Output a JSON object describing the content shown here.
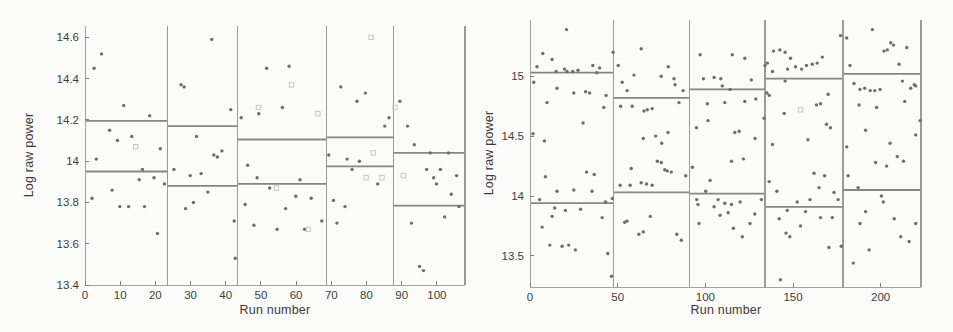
{
  "figure": {
    "background": "#fbfbf9",
    "point_color": "#6d6d6d",
    "square_color": "#c7c7c7",
    "mean_line_color": "#868686",
    "divider_color": "#9a9a9a",
    "axis_color": "#a2a2a2",
    "tick_color": "#7e7e7e",
    "text_color": "#3d3d3d"
  },
  "chart_data": [
    {
      "type": "scatter",
      "title": "",
      "xlabel": "Run number",
      "ylabel": "Log raw power",
      "xlim": [
        0,
        108
      ],
      "ylim": [
        13.4,
        14.655
      ],
      "xticks": [
        0,
        10,
        20,
        30,
        40,
        50,
        60,
        70,
        80,
        90,
        100
      ],
      "yticks": [
        13.4,
        13.6,
        13.8,
        14,
        14.2,
        14.4,
        14.6
      ],
      "grid": false,
      "legend": null,
      "segment_boundaries": [
        0,
        23.4,
        43.3,
        68.6,
        87.6,
        108
      ],
      "segments": [
        {
          "upper": 14.195,
          "lower": 13.95
        },
        {
          "upper": 14.17,
          "lower": 13.88
        },
        {
          "upper": 14.105,
          "lower": 13.89
        },
        {
          "upper": 14.115,
          "lower": 13.975
        },
        {
          "upper": 14.04,
          "lower": 13.785
        }
      ],
      "points": [
        [
          2.6,
          14.45
        ],
        [
          4.7,
          14.52
        ],
        [
          11,
          14.27
        ],
        [
          18.4,
          14.22
        ],
        [
          7,
          14.15
        ],
        [
          9.2,
          14.1
        ],
        [
          13.3,
          14.12
        ],
        [
          21.4,
          14.06
        ],
        [
          3.2,
          14.01
        ],
        [
          16.3,
          13.96
        ],
        [
          19.6,
          13.92
        ],
        [
          15.4,
          13.91
        ],
        [
          7.7,
          13.86
        ],
        [
          2.0,
          13.82
        ],
        [
          9.9,
          13.78
        ],
        [
          12.4,
          13.78
        ],
        [
          16.9,
          13.78
        ],
        [
          20.6,
          13.65
        ],
        [
          22.6,
          13.89
        ],
        [
          27.3,
          14.37
        ],
        [
          28.2,
          14.36
        ],
        [
          36,
          14.59
        ],
        [
          41.4,
          14.25
        ],
        [
          31.7,
          14.12
        ],
        [
          36.6,
          14.03
        ],
        [
          37.6,
          14.02
        ],
        [
          38.9,
          14.05
        ],
        [
          25.3,
          13.96
        ],
        [
          29.9,
          13.93
        ],
        [
          33,
          13.94
        ],
        [
          34.9,
          13.85
        ],
        [
          28.6,
          13.77
        ],
        [
          30.8,
          13.8
        ],
        [
          42.4,
          13.71
        ],
        [
          42.7,
          13.53
        ],
        [
          44.4,
          14.21
        ],
        [
          51.6,
          14.45
        ],
        [
          58,
          14.46
        ],
        [
          56.1,
          14.26
        ],
        [
          49.4,
          14.23
        ],
        [
          46.2,
          13.98
        ],
        [
          48.9,
          13.92
        ],
        [
          52.5,
          13.87
        ],
        [
          61.1,
          13.91
        ],
        [
          59.9,
          13.83
        ],
        [
          64.3,
          13.82
        ],
        [
          57,
          13.77
        ],
        [
          54.6,
          13.67
        ],
        [
          62.4,
          13.67
        ],
        [
          67.3,
          13.71
        ],
        [
          45.5,
          13.79
        ],
        [
          48,
          13.69
        ],
        [
          72.7,
          14.36
        ],
        [
          79.7,
          14.33
        ],
        [
          77.3,
          14.29
        ],
        [
          86.4,
          14.21
        ],
        [
          85.2,
          14.17
        ],
        [
          69.3,
          14.03
        ],
        [
          74.5,
          14.01
        ],
        [
          78,
          14.0
        ],
        [
          75.9,
          13.96
        ],
        [
          83.2,
          13.89
        ],
        [
          70.6,
          13.81
        ],
        [
          73.9,
          13.78
        ],
        [
          71.6,
          13.7
        ],
        [
          89.5,
          14.29
        ],
        [
          91.7,
          14.17
        ],
        [
          93.6,
          14.08
        ],
        [
          98.1,
          14.04
        ],
        [
          103.3,
          14.04
        ],
        [
          97.1,
          13.96
        ],
        [
          101,
          13.96
        ],
        [
          99.1,
          13.92
        ],
        [
          99.9,
          13.89
        ],
        [
          105.6,
          13.93
        ],
        [
          104.1,
          13.84
        ],
        [
          106.3,
          13.78
        ],
        [
          102.2,
          13.73
        ],
        [
          92.8,
          13.7
        ],
        [
          95.1,
          13.49
        ],
        [
          96.2,
          13.47
        ]
      ],
      "outlier_squares": [
        [
          14.4,
          14.07
        ],
        [
          49.3,
          14.26
        ],
        [
          58.7,
          14.37
        ],
        [
          66.2,
          14.23
        ],
        [
          81.3,
          14.6
        ],
        [
          54.4,
          13.87
        ],
        [
          63.5,
          13.67
        ],
        [
          79.9,
          13.92
        ],
        [
          84.4,
          13.92
        ],
        [
          81.9,
          14.04
        ],
        [
          88.1,
          14.26
        ],
        [
          90.5,
          13.93
        ]
      ]
    },
    {
      "type": "scatter",
      "title": "",
      "xlabel": "Run number",
      "ylabel": "Log raw power",
      "xlim": [
        0,
        223
      ],
      "ylim": [
        13.24,
        15.47
      ],
      "xticks": [
        0,
        50,
        100,
        150,
        200
      ],
      "yticks": [
        13.5,
        14,
        14.5,
        15
      ],
      "grid": false,
      "legend": null,
      "segment_boundaries": [
        0,
        47.5,
        91,
        134,
        178.5,
        223
      ],
      "segments": [
        {
          "upper": 15.03,
          "lower": 13.94
        },
        {
          "upper": 14.82,
          "lower": 14.03
        },
        {
          "upper": 14.89,
          "lower": 14.02
        },
        {
          "upper": 14.98,
          "lower": 13.91
        },
        {
          "upper": 15.02,
          "lower": 14.05
        }
      ],
      "points": [
        [
          20.8,
          15.39
        ],
        [
          7.3,
          15.19
        ],
        [
          12.6,
          15.14
        ],
        [
          4.0,
          15.08
        ],
        [
          14.9,
          15.04
        ],
        [
          19.7,
          15.06
        ],
        [
          21.1,
          15.04
        ],
        [
          24.4,
          15.04
        ],
        [
          27.4,
          15.05
        ],
        [
          35.8,
          15.09
        ],
        [
          39.7,
          15.07
        ],
        [
          38.1,
          15.03
        ],
        [
          2.1,
          14.95
        ],
        [
          15.4,
          14.9
        ],
        [
          25,
          14.86
        ],
        [
          31.7,
          14.87
        ],
        [
          34,
          14.86
        ],
        [
          9.7,
          14.78
        ],
        [
          43.4,
          14.84
        ],
        [
          42.1,
          14.74
        ],
        [
          30.3,
          14.61
        ],
        [
          1.7,
          14.52
        ],
        [
          8.2,
          14.46
        ],
        [
          8.8,
          14.16
        ],
        [
          15.4,
          14.04
        ],
        [
          25,
          14.05
        ],
        [
          32.2,
          14.2
        ],
        [
          36.6,
          14.18
        ],
        [
          35.4,
          14.04
        ],
        [
          5.5,
          13.97
        ],
        [
          43.1,
          13.95
        ],
        [
          47,
          13.98
        ],
        [
          14.1,
          13.9
        ],
        [
          20.2,
          13.88
        ],
        [
          28.8,
          13.89
        ],
        [
          12.6,
          13.83
        ],
        [
          41.1,
          13.82
        ],
        [
          6.9,
          13.74
        ],
        [
          11.3,
          13.59
        ],
        [
          18.3,
          13.58
        ],
        [
          22.1,
          13.59
        ],
        [
          25.9,
          13.55
        ],
        [
          44.4,
          13.52
        ],
        [
          46.5,
          13.33
        ],
        [
          63.4,
          15.23
        ],
        [
          47.4,
          15.2
        ],
        [
          50.3,
          15.09
        ],
        [
          59.3,
          15.01
        ],
        [
          74.8,
          15.0
        ],
        [
          52.6,
          14.95
        ],
        [
          55.4,
          14.88
        ],
        [
          51.7,
          14.75
        ],
        [
          58.3,
          14.75
        ],
        [
          65,
          14.71
        ],
        [
          66.9,
          14.72
        ],
        [
          69.7,
          14.73
        ],
        [
          64.6,
          14.48
        ],
        [
          71.7,
          14.5
        ],
        [
          78.9,
          15.08
        ],
        [
          82.1,
          14.98
        ],
        [
          82.7,
          14.93
        ],
        [
          87.3,
          14.88
        ],
        [
          85,
          14.78
        ],
        [
          78.7,
          14.53
        ],
        [
          75.1,
          14.44
        ],
        [
          51.4,
          14.09
        ],
        [
          57.1,
          14.09
        ],
        [
          63.4,
          14.11
        ],
        [
          66.5,
          14.1
        ],
        [
          69.7,
          14.09
        ],
        [
          57.7,
          14.23
        ],
        [
          72.6,
          14.29
        ],
        [
          74.9,
          14.28
        ],
        [
          76.8,
          14.22
        ],
        [
          78.3,
          14.21
        ],
        [
          80.6,
          14.2
        ],
        [
          88.8,
          14.17
        ],
        [
          54,
          13.78
        ],
        [
          55.4,
          13.79
        ],
        [
          62.1,
          13.68
        ],
        [
          64.6,
          13.7
        ],
        [
          68.6,
          13.83
        ],
        [
          86.3,
          13.63
        ],
        [
          83.7,
          13.68
        ],
        [
          97,
          15.18
        ],
        [
          115.4,
          15.18
        ],
        [
          122.5,
          15.15
        ],
        [
          98.9,
          14.98
        ],
        [
          105,
          14.99
        ],
        [
          108.8,
          14.98
        ],
        [
          109.7,
          14.92
        ],
        [
          126.3,
          14.97
        ],
        [
          114.1,
          14.89
        ],
        [
          101.1,
          14.77
        ],
        [
          111.1,
          14.78
        ],
        [
          122.5,
          14.79
        ],
        [
          128.8,
          14.81
        ],
        [
          101.5,
          14.63
        ],
        [
          94.9,
          14.57
        ],
        [
          116.8,
          14.53
        ],
        [
          119.3,
          14.54
        ],
        [
          128.4,
          14.48
        ],
        [
          92.6,
          14.24
        ],
        [
          114.9,
          14.29
        ],
        [
          121.7,
          14.31
        ],
        [
          102.7,
          14.13
        ],
        [
          100.2,
          14.04
        ],
        [
          107.3,
          13.97
        ],
        [
          111.1,
          13.94
        ],
        [
          114.9,
          13.93
        ],
        [
          119.8,
          13.95
        ],
        [
          95.1,
          13.97
        ],
        [
          95.8,
          13.93
        ],
        [
          105,
          13.91
        ],
        [
          108.4,
          13.84
        ],
        [
          113,
          13.86
        ],
        [
          128.2,
          13.85
        ],
        [
          125.5,
          13.77
        ],
        [
          116,
          13.73
        ],
        [
          121.1,
          13.66
        ],
        [
          96.4,
          13.77
        ],
        [
          132,
          13.97
        ],
        [
          135.4,
          15.11
        ],
        [
          138.9,
          15.21
        ],
        [
          142.5,
          15.22
        ],
        [
          145.5,
          15.2
        ],
        [
          134,
          15.09
        ],
        [
          138.3,
          15.04
        ],
        [
          146.9,
          15.06
        ],
        [
          148.6,
          15.15
        ],
        [
          151.4,
          15.08
        ],
        [
          154.9,
          15.06
        ],
        [
          157.7,
          15.09
        ],
        [
          161,
          15.1
        ],
        [
          163.8,
          15.11
        ],
        [
          166.7,
          15.16
        ],
        [
          177.1,
          15.34
        ],
        [
          145.5,
          14.96
        ],
        [
          135.1,
          14.86
        ],
        [
          136.4,
          14.84
        ],
        [
          170,
          14.85
        ],
        [
          163.4,
          14.76
        ],
        [
          165.7,
          14.77
        ],
        [
          145,
          14.69
        ],
        [
          133.5,
          14.65
        ],
        [
          169.1,
          14.6
        ],
        [
          171.4,
          14.57
        ],
        [
          158.5,
          14.47
        ],
        [
          138.3,
          14.43
        ],
        [
          136.4,
          14.12
        ],
        [
          140.8,
          14.04
        ],
        [
          162,
          14.19
        ],
        [
          168,
          14.17
        ],
        [
          164.8,
          14.07
        ],
        [
          173.4,
          14.03
        ],
        [
          159.7,
          13.97
        ],
        [
          175.7,
          13.97
        ],
        [
          152.4,
          13.95
        ],
        [
          157.1,
          13.87
        ],
        [
          146.7,
          13.88
        ],
        [
          165.7,
          13.82
        ],
        [
          172.4,
          13.82
        ],
        [
          154.3,
          13.75
        ],
        [
          148.2,
          13.66
        ],
        [
          170.5,
          13.57
        ],
        [
          177.5,
          13.58
        ],
        [
          142.1,
          13.81
        ],
        [
          146,
          13.69
        ],
        [
          142.8,
          13.3
        ],
        [
          180.6,
          15.32
        ],
        [
          195.3,
          15.39
        ],
        [
          205.7,
          15.28
        ],
        [
          207.3,
          15.26
        ],
        [
          214.9,
          15.24
        ],
        [
          201.9,
          15.21
        ],
        [
          203.8,
          15.22
        ],
        [
          210.5,
          15.1
        ],
        [
          182.5,
          15.09
        ],
        [
          184.8,
          14.94
        ],
        [
          212.4,
          14.96
        ],
        [
          219.1,
          14.93
        ],
        [
          217.1,
          14.9
        ],
        [
          220,
          14.92
        ],
        [
          188.2,
          14.89
        ],
        [
          190.9,
          14.9
        ],
        [
          194,
          14.88
        ],
        [
          196.6,
          14.88
        ],
        [
          199.7,
          14.89
        ],
        [
          187.7,
          14.76
        ],
        [
          197.7,
          14.74
        ],
        [
          213.7,
          14.79
        ],
        [
          222.5,
          14.63
        ],
        [
          191.4,
          14.55
        ],
        [
          205.4,
          14.44
        ],
        [
          220,
          14.51
        ],
        [
          180.6,
          14.41
        ],
        [
          181.4,
          14.17
        ],
        [
          197.1,
          14.28
        ],
        [
          209.5,
          14.33
        ],
        [
          213,
          14.29
        ],
        [
          203.4,
          14.25
        ],
        [
          187.1,
          14.07
        ],
        [
          200.4,
          14.0
        ],
        [
          201.5,
          13.95
        ],
        [
          191.4,
          13.87
        ],
        [
          188.2,
          13.77
        ],
        [
          207.7,
          13.81
        ],
        [
          220,
          13.77
        ],
        [
          211.4,
          13.66
        ],
        [
          216.2,
          13.62
        ],
        [
          193.4,
          13.55
        ],
        [
          184.4,
          13.44
        ]
      ],
      "outlier_squares": [
        [
          154.3,
          14.72
        ]
      ]
    }
  ]
}
